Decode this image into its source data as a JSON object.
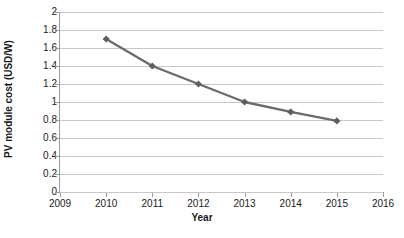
{
  "chart_data": {
    "type": "line",
    "title": "",
    "xlabel": "Year",
    "ylabel": "PV module cost (USD/W)",
    "x": [
      2010,
      2011,
      2012,
      2013,
      2014,
      2015
    ],
    "values": [
      1.7,
      1.4,
      1.2,
      1.0,
      0.89,
      0.79
    ],
    "series": [
      {
        "name": "PV module cost",
        "values": [
          1.7,
          1.4,
          1.2,
          1.0,
          0.89,
          0.79
        ]
      }
    ],
    "xlim": [
      2009,
      2016
    ],
    "ylim": [
      0,
      2
    ],
    "x_ticks": [
      "2009",
      "2010",
      "2011",
      "2012",
      "2013",
      "2014",
      "2015",
      "2016"
    ],
    "y_ticks": [
      "2",
      "1.8",
      "1.6",
      "1.4",
      "1.2",
      "1",
      "0.8",
      "0.6",
      "0.4",
      "0.2",
      "0"
    ],
    "y_tick_values": [
      2,
      1.8,
      1.6,
      1.4,
      1.2,
      1,
      0.8,
      0.6,
      0.4,
      0.2,
      0
    ],
    "grid": "horizontal",
    "legend": "none",
    "marker": "diamond",
    "colors": {
      "line": "#6b6b6b",
      "marker": "#5f5f5f",
      "gridline": "#c8c8c8",
      "axis": "#9a9a9a",
      "text": "#1a1a1a",
      "background": "#ffffff"
    }
  }
}
